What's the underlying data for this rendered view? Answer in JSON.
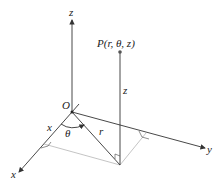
{
  "diagram": {
    "labels": {
      "z_axis": "z",
      "x_axis": "x",
      "y_axis": "y",
      "origin": "O",
      "point": "P(r, θ, z)",
      "height": "z",
      "radius": "r",
      "angle": "θ",
      "x_component": "x"
    },
    "colors": {
      "line": "#333333",
      "dashed": "#aaaaaa",
      "point": "#555555"
    }
  }
}
